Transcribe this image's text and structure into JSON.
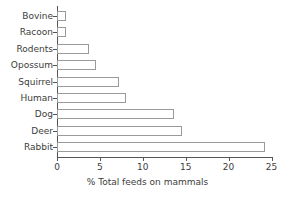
{
  "chart_data": {
    "type": "bar",
    "orientation": "horizontal",
    "title": "",
    "xlabel": "% Total feeds on mammals",
    "ylabel": "",
    "xlim": [
      0,
      25
    ],
    "xticks": [
      0,
      5,
      10,
      15,
      20,
      25
    ],
    "grid": false,
    "legend": false,
    "categories": [
      "Bovine",
      "Racoon",
      "Rodents",
      "Opossum",
      "Squirrel",
      "Human",
      "Dog",
      "Deer",
      "Rabbit"
    ],
    "values": [
      1.0,
      1.0,
      3.7,
      4.6,
      7.2,
      8.0,
      13.6,
      14.6,
      24.2
    ],
    "bar_face_color": "#ffffff",
    "bar_edge_color": "#9a9a9a",
    "axis_color": "#555555",
    "text_color": "#3c3c3c",
    "background_color": "#ffffff"
  },
  "axis": {
    "tick_labels": [
      "0",
      "5",
      "10",
      "15",
      "20",
      "25"
    ],
    "title": "% Total feeds on mammals"
  },
  "bars": [
    {
      "label": "Bovine",
      "value": 1.0
    },
    {
      "label": "Racoon",
      "value": 1.0
    },
    {
      "label": "Rodents",
      "value": 3.7
    },
    {
      "label": "Opossum",
      "value": 4.6
    },
    {
      "label": "Squirrel",
      "value": 7.2
    },
    {
      "label": "Human",
      "value": 8.0
    },
    {
      "label": "Dog",
      "value": 13.6
    },
    {
      "label": "Deer",
      "value": 14.6
    },
    {
      "label": "Rabbit",
      "value": 24.2
    }
  ]
}
